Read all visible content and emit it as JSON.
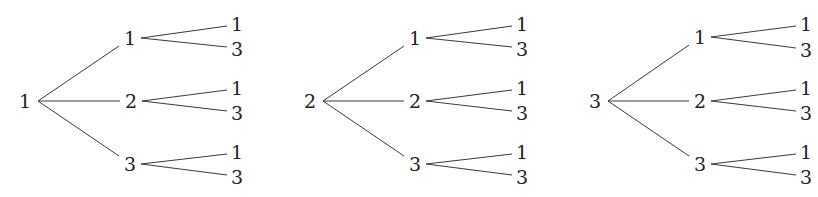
{
  "diagram": {
    "type": "tree",
    "colors": {
      "line": "#3a3a3a",
      "text": "#222222",
      "background": "#ffffff"
    },
    "trees": [
      {
        "root": "1",
        "root_pos": [
          25,
          101
        ],
        "root_anchor": [
          38,
          101
        ],
        "branches": [
          {
            "label": "1",
            "pos": [
              130,
              38
            ],
            "leaves": [
              {
                "label": "1",
                "pos": [
                  237,
                  24
                ]
              },
              {
                "label": "3",
                "pos": [
                  237,
                  49
                ]
              }
            ]
          },
          {
            "label": "2",
            "pos": [
              131,
              101
            ],
            "leaves": [
              {
                "label": "1",
                "pos": [
                  237,
                  88
                ]
              },
              {
                "label": "3",
                "pos": [
                  237,
                  113
                ]
              }
            ]
          },
          {
            "label": "3",
            "pos": [
              130,
              164
            ],
            "leaves": [
              {
                "label": "1",
                "pos": [
                  237,
                  152
                ]
              },
              {
                "label": "3",
                "pos": [
                  237,
                  177
                ]
              }
            ]
          }
        ]
      },
      {
        "root": "2",
        "root_pos": [
          310,
          101
        ],
        "root_anchor": [
          323,
          101
        ],
        "branches": [
          {
            "label": "1",
            "pos": [
              415,
              38
            ],
            "leaves": [
              {
                "label": "1",
                "pos": [
                  522,
                  24
                ]
              },
              {
                "label": "3",
                "pos": [
                  522,
                  49
                ]
              }
            ]
          },
          {
            "label": "2",
            "pos": [
              415,
              101
            ],
            "leaves": [
              {
                "label": "1",
                "pos": [
                  522,
                  88
                ]
              },
              {
                "label": "3",
                "pos": [
                  522,
                  113
                ]
              }
            ]
          },
          {
            "label": "3",
            "pos": [
              415,
              164
            ],
            "leaves": [
              {
                "label": "1",
                "pos": [
                  522,
                  152
                ]
              },
              {
                "label": "3",
                "pos": [
                  522,
                  177
                ]
              }
            ]
          }
        ]
      },
      {
        "root": "3",
        "root_pos": [
          595,
          101
        ],
        "root_anchor": [
          608,
          101
        ],
        "branches": [
          {
            "label": "1",
            "pos": [
              700,
              37
            ],
            "leaves": [
              {
                "label": "1",
                "pos": [
                  806,
                  24
                ]
              },
              {
                "label": "3",
                "pos": [
                  806,
                  50
                ]
              }
            ]
          },
          {
            "label": "2",
            "pos": [
              700,
              101
            ],
            "leaves": [
              {
                "label": "1",
                "pos": [
                  806,
                  88
                ]
              },
              {
                "label": "3",
                "pos": [
                  806,
                  113
                ]
              }
            ]
          },
          {
            "label": "3",
            "pos": [
              700,
              164
            ],
            "leaves": [
              {
                "label": "1",
                "pos": [
                  806,
                  152
                ]
              },
              {
                "label": "3",
                "pos": [
                  806,
                  177
                ]
              }
            ]
          }
        ]
      }
    ]
  }
}
